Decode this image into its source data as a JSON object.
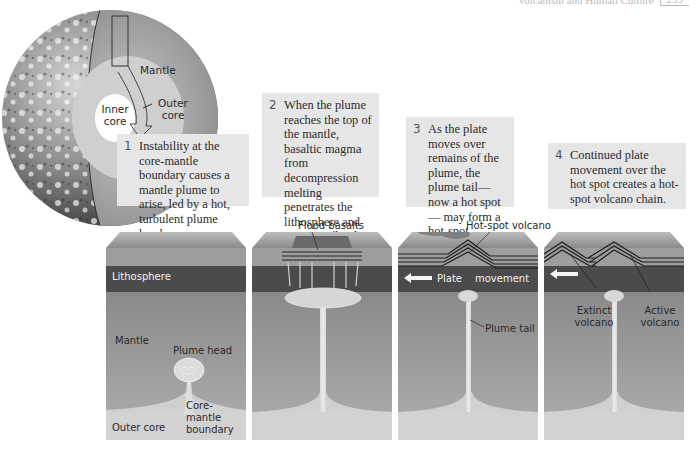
{
  "header": {
    "running_title": "Volcanism and Human Culture",
    "page_number": "259"
  },
  "globe": {
    "labels": {
      "mantle": "Mantle",
      "outer_core": "Outer core",
      "inner_core": "Inner core"
    }
  },
  "captions": [
    {
      "number": "1",
      "text": "Instability at the core-mantle boundary causes a mantle plume to arise, led by a hot, turbulent plume head."
    },
    {
      "number": "2",
      "text": "When the plume reaches the top of the mantle, basaltic magma from decompression melting penetrates the lithosphere and erupts as flood basalts."
    },
    {
      "number": "3",
      "text": "As the plate moves over remains of the plume, the plume tail—now a hot spot— may form a hot-spot volcano."
    },
    {
      "number": "4",
      "text": "Continued plate movement over the hot spot creates a hot-spot volcano chain."
    }
  ],
  "blocks": [
    {
      "labels": {
        "lithosphere": "Lithosphere",
        "mantle": "Mantle",
        "plume_head": "Plume head",
        "core_mantle_boundary": "Core-mantle boundary",
        "outer_core": "Outer core"
      }
    },
    {
      "labels": {
        "flood_basalts": "Flood basalts"
      }
    },
    {
      "labels": {
        "hot_spot_volcano": "Hot-spot volcano",
        "plate": "Plate",
        "movement": "movement",
        "plume_tail": "Plume tail"
      }
    },
    {
      "labels": {
        "extinct_volcano": "Extinct volcano",
        "active_volcano": "Active volcano"
      }
    }
  ],
  "colors": {
    "caption_bg": "#e6e6e6",
    "lithosphere": "#4a4a4a",
    "mantle_top": "#8c8c8c",
    "mantle_bottom": "#a8a8a8",
    "outer_core": "#d2d2d2",
    "plume": "#e0e0e0"
  }
}
